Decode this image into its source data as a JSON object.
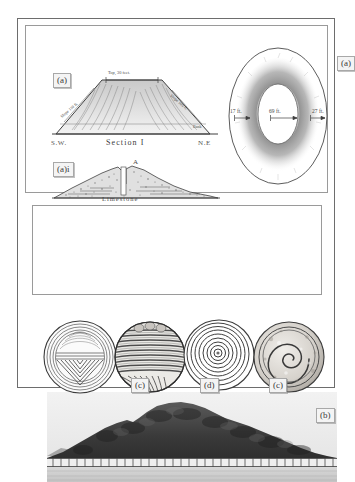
{
  "figure": {
    "border_color": "#6d6d6d",
    "ink_color": "#4b4b4b",
    "background": "#ffffff"
  },
  "panels": {
    "top": {
      "section": {
        "tag": "(a)",
        "caption_title": "Section I",
        "caption_left": "S.W.",
        "caption_right": "N.E",
        "label_top": "Top, 30 feet.",
        "label_left_slope": "Slope 110 ft.",
        "label_right_slope": "Slope 100 ft.",
        "label_right_small": "Bank"
      },
      "subsection": {
        "tag": "(a)i",
        "label_apex": "A",
        "label_base": "Limestone"
      },
      "plan": {
        "tag": "(a)",
        "dim_left": "17 ft.",
        "dim_center": "69 ft.",
        "dim_right": "27 ft."
      }
    },
    "photo": {
      "tag": "(b)",
      "subject": "photograph of large earthen mound behind a fence"
    },
    "discs": {
      "items": [
        {
          "tag": "",
          "pattern": "concentric-rings-with-chevron-triangle"
        },
        {
          "tag": "(c)",
          "pattern": "horizontal-banded-coiled"
        },
        {
          "tag": "(d)",
          "pattern": "concentric-circles"
        },
        {
          "tag": "(c)",
          "pattern": "spiral-scroll"
        }
      ]
    }
  }
}
